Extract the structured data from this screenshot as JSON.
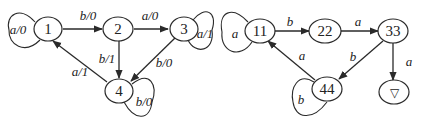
{
  "diagrams": [
    {
      "name": "mealy-machine",
      "nodes": [
        {
          "id": "1",
          "label": "1",
          "x": 48,
          "y": 29
        },
        {
          "id": "2",
          "label": "2",
          "x": 118,
          "y": 29
        },
        {
          "id": "3",
          "label": "3",
          "x": 184,
          "y": 29
        },
        {
          "id": "4",
          "label": "4",
          "x": 119,
          "y": 91
        }
      ],
      "edges": [
        {
          "from": "1",
          "to": "1",
          "label": "a/0"
        },
        {
          "from": "1",
          "to": "2",
          "label": "b/0"
        },
        {
          "from": "2",
          "to": "3",
          "label": "a/0"
        },
        {
          "from": "2",
          "to": "4",
          "label": "b/1"
        },
        {
          "from": "3",
          "to": "3",
          "label": "a/1"
        },
        {
          "from": "3",
          "to": "4",
          "label": "b/0"
        },
        {
          "from": "4",
          "to": "1",
          "label": "a/1"
        },
        {
          "from": "4",
          "to": "4",
          "label": "b/0"
        }
      ]
    },
    {
      "name": "automaton",
      "nodes": [
        {
          "id": "11",
          "label": "11",
          "x": 260,
          "y": 31
        },
        {
          "id": "22",
          "label": "22",
          "x": 325,
          "y": 31
        },
        {
          "id": "33",
          "label": "33",
          "x": 393,
          "y": 31
        },
        {
          "id": "44",
          "label": "44",
          "x": 327,
          "y": 89
        },
        {
          "id": "sink",
          "label": "▽",
          "x": 394,
          "y": 92
        }
      ],
      "edges": [
        {
          "from": "11",
          "to": "11",
          "label": "a"
        },
        {
          "from": "11",
          "to": "22",
          "label": "b"
        },
        {
          "from": "22",
          "to": "33",
          "label": "a"
        },
        {
          "from": "33",
          "to": "44",
          "label": "b"
        },
        {
          "from": "33",
          "to": "sink",
          "label": "a"
        },
        {
          "from": "44",
          "to": "11",
          "label": "a"
        },
        {
          "from": "44",
          "to": "44",
          "label": "b"
        }
      ]
    }
  ]
}
